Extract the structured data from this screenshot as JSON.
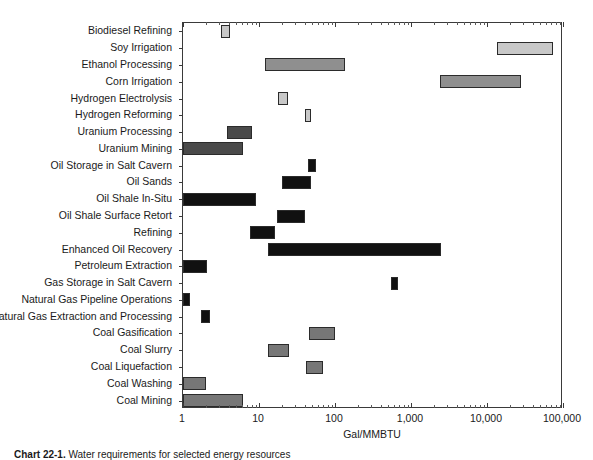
{
  "chart_data": {
    "type": "bar",
    "orientation": "horizontal",
    "variant": "range-bar",
    "title": "",
    "xlabel": "Gal/MMBTU",
    "ylabel": "",
    "xscale": "log",
    "xlim": [
      1,
      100000
    ],
    "grid": false,
    "legend": null,
    "xticks": [
      1,
      10,
      100,
      1000,
      10000,
      100000
    ],
    "xticklabels": [
      "1",
      "10",
      "100",
      "1,000",
      "10,000",
      "100,000"
    ],
    "categories": [
      "Biodiesel Refining",
      "Soy Irrigation",
      "Ethanol Processing",
      "Corn Irrigation",
      "Hydrogen Electrolysis",
      "Hydrogen Reforming",
      "Uranium Processing",
      "Uranium Mining",
      "Oil Storage in Salt Cavern",
      "Oil Sands",
      "Oil Shale In-Situ",
      "Oil Shale Surface Retort",
      "Refining",
      "Enhanced Oil Recovery",
      "Petroleum Extraction",
      "Gas Storage in Salt Cavern",
      "Natural Gas Pipeline Operations",
      "Natural Gas Extraction and Processing",
      "Coal Gasification",
      "Coal Slurry",
      "Coal Liquefaction",
      "Coal Washing",
      "Coal Mining"
    ],
    "bars": [
      {
        "label": "Biodiesel Refining",
        "low": 3.2,
        "high": 4.1,
        "color": "#c8c8c8"
      },
      {
        "label": "Soy Irrigation",
        "low": 13500,
        "high": 75000,
        "color": "#c8c8c8"
      },
      {
        "label": "Ethanol Processing",
        "low": 12,
        "high": 135,
        "color": "#8f8f8f"
      },
      {
        "label": "Corn Irrigation",
        "low": 2400,
        "high": 28000,
        "color": "#8f8f8f"
      },
      {
        "label": "Hydrogen Electrolysis",
        "low": 18,
        "high": 24,
        "color": "#c8c8c8"
      },
      {
        "label": "Hydrogen Reforming",
        "low": 40,
        "high": 49,
        "color": "#c8c8c8"
      },
      {
        "label": "Uranium Processing",
        "low": 3.8,
        "high": 8.0,
        "color": "#4a4a4a"
      },
      {
        "label": "Uranium Mining",
        "low": 1.0,
        "high": 6.2,
        "color": "#4a4a4a"
      },
      {
        "label": "Oil Storage in Salt Cavern",
        "low": 44,
        "high": 56,
        "color": "#111111"
      },
      {
        "label": "Oil Sands",
        "low": 20,
        "high": 49,
        "color": "#111111"
      },
      {
        "label": "Oil Shale In-Situ",
        "low": 1.0,
        "high": 9.0,
        "color": "#111111"
      },
      {
        "label": "Oil Shale Surface Retort",
        "low": 17,
        "high": 40,
        "color": "#111111"
      },
      {
        "label": "Refining",
        "low": 7.5,
        "high": 16,
        "color": "#111111"
      },
      {
        "label": "Enhanced Oil Recovery",
        "low": 13,
        "high": 2500,
        "color": "#111111"
      },
      {
        "label": "Petroleum Extraction",
        "low": 1.0,
        "high": 2.1,
        "color": "#111111"
      },
      {
        "label": "Gas Storage in Salt Cavern",
        "low": 540,
        "high": 670,
        "color": "#111111"
      },
      {
        "label": "Natural Gas Pipeline Operations",
        "low": 1.0,
        "high": 1.25,
        "color": "#111111"
      },
      {
        "label": "Natural Gas Extraction and Processing",
        "low": 1.75,
        "high": 2.25,
        "color": "#111111"
      },
      {
        "label": "Coal Gasification",
        "low": 46,
        "high": 100,
        "color": "#777777"
      },
      {
        "label": "Coal Slurry",
        "low": 13,
        "high": 25,
        "color": "#777777"
      },
      {
        "label": "Coal Liquefaction",
        "low": 41,
        "high": 70,
        "color": "#777777"
      },
      {
        "label": "Coal Washing",
        "low": 1.0,
        "high": 2.0,
        "color": "#777777"
      },
      {
        "label": "Coal Mining",
        "low": 1.0,
        "high": 6.2,
        "color": "#777777"
      }
    ]
  },
  "axis": {
    "x_title": "Gal/MMBTU"
  },
  "caption": {
    "number": "Chart 22-1.",
    "text": "Water requirements for selected energy resources"
  }
}
